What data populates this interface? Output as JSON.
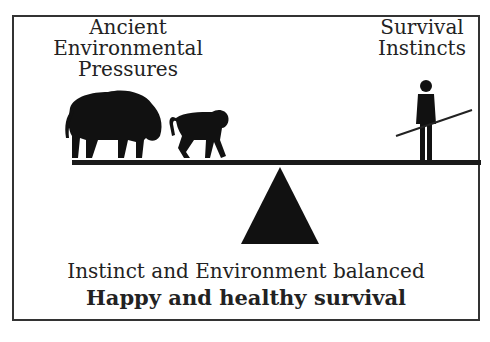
{
  "labels": {
    "left": [
      "Ancient",
      "Environmental",
      "Pressures"
    ],
    "right": [
      "Survival",
      "Instincts"
    ]
  },
  "caption": {
    "line1": "Instinct and Environment balanced",
    "line2": "Happy and healthy survival"
  },
  "icons": {
    "left_figures": [
      "bison-icon",
      "baboon-icon"
    ],
    "right_figure": "human-with-spear-icon",
    "fulcrum": "triangle-fulcrum",
    "beam": "balance-beam"
  },
  "colors": {
    "ink": "#1a1a1a",
    "border": "#333333",
    "background": "#ffffff"
  }
}
